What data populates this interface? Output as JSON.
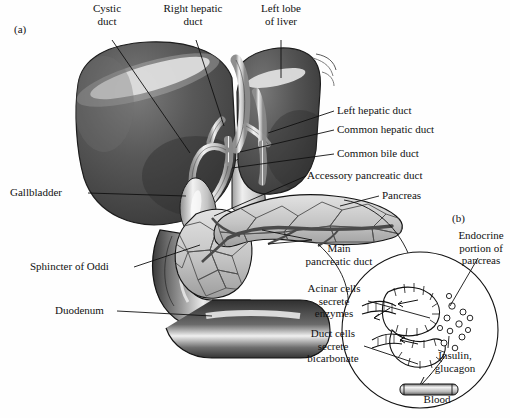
{
  "figure": {
    "panel_a_marker": "(a)",
    "panel_b_marker": "(b)"
  },
  "labels_panel_a": [
    {
      "id": "cystic-duct",
      "lines": [
        "Cystic",
        "duct"
      ],
      "x": 107,
      "y": 12,
      "anchor": "middle"
    },
    {
      "id": "right-hepatic-duct",
      "lines": [
        "Right hepatic",
        "duct"
      ],
      "x": 193,
      "y": 12,
      "anchor": "middle"
    },
    {
      "id": "left-lobe-of-liver",
      "lines": [
        "Left lobe",
        "of liver"
      ],
      "x": 281,
      "y": 12,
      "anchor": "middle"
    },
    {
      "id": "left-hepatic-duct",
      "lines": [
        "Left hepatic duct"
      ],
      "x": 337,
      "y": 114,
      "anchor": "start"
    },
    {
      "id": "common-hepatic-duct",
      "lines": [
        "Common hepatic duct"
      ],
      "x": 337,
      "y": 133,
      "anchor": "start"
    },
    {
      "id": "common-bile-duct",
      "lines": [
        "Common bile duct"
      ],
      "x": 337,
      "y": 157,
      "anchor": "start"
    },
    {
      "id": "accessory-pancreatic-duct",
      "lines": [
        "Accessory pancreatic duct"
      ],
      "x": 307,
      "y": 179,
      "anchor": "start"
    },
    {
      "id": "pancreas",
      "lines": [
        "Pancreas"
      ],
      "x": 382,
      "y": 199,
      "anchor": "start"
    },
    {
      "id": "gallbladder",
      "lines": [
        "Gallbladder"
      ],
      "x": 10,
      "y": 196,
      "anchor": "start"
    },
    {
      "id": "sphincter-of-oddi",
      "lines": [
        "Sphincter of Oddi"
      ],
      "x": 30,
      "y": 270,
      "anchor": "start"
    },
    {
      "id": "duodenum",
      "lines": [
        "Duodenum"
      ],
      "x": 55,
      "y": 314,
      "anchor": "start"
    },
    {
      "id": "main-pancreatic-duct",
      "lines": [
        "Main",
        "pancreatic duct"
      ],
      "x": 339,
      "y": 252,
      "anchor": "middle"
    }
  ],
  "labels_panel_b": [
    {
      "id": "endocrine-portion-of-pancreas",
      "lines": [
        "Endocrine",
        "portion of",
        "pancreas"
      ],
      "x": 481,
      "y": 239,
      "anchor": "middle"
    },
    {
      "id": "acinar-cells-secrete-enzymes",
      "lines": [
        "Acinar cells",
        "secrete",
        "enzymes"
      ],
      "x": 334,
      "y": 292,
      "anchor": "middle"
    },
    {
      "id": "duct-cells-secrete-bicarbonate",
      "lines": [
        "Duct cells",
        "secrete",
        "bicarbonate"
      ],
      "x": 333,
      "y": 337,
      "anchor": "middle"
    },
    {
      "id": "insulin-glucagon",
      "lines": [
        "Insulin,",
        "glucagon"
      ],
      "x": 455,
      "y": 359,
      "anchor": "middle"
    },
    {
      "id": "blood",
      "lines": [
        "Blood"
      ],
      "x": 437,
      "y": 403,
      "anchor": "middle"
    }
  ],
  "colors": {
    "liver_dark": "#4a4a4a",
    "liver_mid": "#5e5e5e",
    "liver_highlight": "#e8e8e8",
    "duct_light": "#d9d9d9",
    "pancreas_fill": "#c9c9c9",
    "duodenum_dark": "#3d3d3d",
    "outline": "#1a1a1a",
    "text": "#111111",
    "background": "#fefefe"
  }
}
